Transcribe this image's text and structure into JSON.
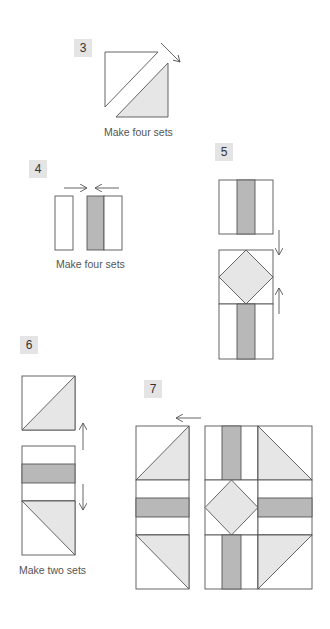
{
  "steps": [
    {
      "number": "3",
      "caption": "Make four sets"
    },
    {
      "number": "4",
      "caption": "Make four sets"
    },
    {
      "number": "5",
      "caption": ""
    },
    {
      "number": "6",
      "caption": "Make two sets"
    },
    {
      "number": "7",
      "caption": ""
    }
  ],
  "colors": {
    "line": "#555555",
    "light_fill": "#e6e6e6",
    "dark_fill": "#b8b8b8",
    "label_bg": "#e4e4e4",
    "background": "#ffffff"
  },
  "icons": {
    "press_arrow": "arrow-icon"
  }
}
